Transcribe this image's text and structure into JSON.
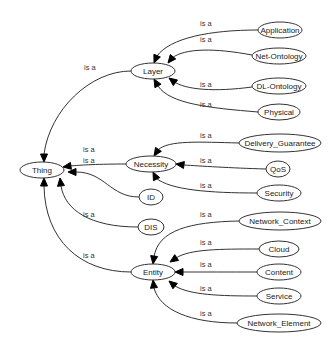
{
  "diagram": {
    "type": "ontology-graph",
    "edge_label": "is a",
    "nodes": [
      {
        "id": "Thing",
        "label": "Thing",
        "cx": 42,
        "cy": 170,
        "rx": 22,
        "ry": 8
      },
      {
        "id": "Layer",
        "label": "Layer",
        "cx": 153,
        "cy": 71,
        "rx": 22,
        "ry": 8
      },
      {
        "id": "Application",
        "label": "Application",
        "cx": 280,
        "cy": 30,
        "rx": 22,
        "ry": 8
      },
      {
        "id": "Net-Ontology",
        "label": "Net-Ontology",
        "cx": 279,
        "cy": 56,
        "rx": 27,
        "ry": 8
      },
      {
        "id": "DL-Ontology",
        "label": "DL-Ontology",
        "cx": 279,
        "cy": 86,
        "rx": 27,
        "ry": 8
      },
      {
        "id": "Physical",
        "label": "Physical",
        "cx": 279,
        "cy": 112,
        "rx": 21,
        "ry": 8
      },
      {
        "id": "Necessity",
        "label": "Necessity",
        "cx": 151,
        "cy": 164,
        "rx": 25,
        "ry": 8
      },
      {
        "id": "Delivery_Guarantee",
        "label": "Delivery_Guarantee",
        "cx": 280,
        "cy": 143,
        "rx": 41,
        "ry": 9
      },
      {
        "id": "QoS",
        "label": "QoS",
        "cx": 278,
        "cy": 169,
        "rx": 12,
        "ry": 8
      },
      {
        "id": "Security",
        "label": "Security",
        "cx": 279,
        "cy": 193,
        "rx": 22,
        "ry": 8
      },
      {
        "id": "ID",
        "label": "ID",
        "cx": 151,
        "cy": 197,
        "rx": 12,
        "ry": 8
      },
      {
        "id": "DIS",
        "label": "DIS",
        "cx": 151,
        "cy": 227,
        "rx": 13,
        "ry": 8
      },
      {
        "id": "Network_Context",
        "label": "Network_Context",
        "cx": 280,
        "cy": 221,
        "rx": 41,
        "ry": 9
      },
      {
        "id": "Cloud",
        "label": "Cloud",
        "cx": 279,
        "cy": 249,
        "rx": 20,
        "ry": 8
      },
      {
        "id": "Content",
        "label": "Content",
        "cx": 279,
        "cy": 272,
        "rx": 22,
        "ry": 8
      },
      {
        "id": "Service",
        "label": "Service",
        "cx": 279,
        "cy": 296,
        "rx": 22,
        "ry": 8
      },
      {
        "id": "Network_Element",
        "label": "Network_Element",
        "cx": 279,
        "cy": 323,
        "rx": 42,
        "ry": 9
      },
      {
        "id": "Entity",
        "label": "Entity",
        "cx": 153,
        "cy": 272,
        "rx": 22,
        "ry": 8
      }
    ],
    "edges": [
      {
        "from": "Layer",
        "to": "Thing",
        "label": "is a",
        "path": "M131,71 C90,71 50,110 44,154",
        "arrow": [
          44,
          162
        ],
        "lx": 84,
        "ly": 70
      },
      {
        "from": "Application",
        "to": "Layer",
        "label": "is a",
        "path": "M258,30 C210,30 170,38 157,56",
        "arrow": [
          154,
          63
        ],
        "lx": 200,
        "ly": 26
      },
      {
        "from": "Net-Ontology",
        "to": "Layer",
        "label": "is a",
        "path": "M252,55 C215,48 185,48 172,58",
        "arrow": [
          168,
          63
        ],
        "lx": 200,
        "ly": 42
      },
      {
        "from": "DL-Ontology",
        "to": "Layer",
        "label": "is a",
        "path": "M252,87 C215,92 185,90 173,81",
        "arrow": [
          169,
          78
        ],
        "lx": 200,
        "ly": 87
      },
      {
        "from": "Physical",
        "to": "Layer",
        "label": "is a",
        "path": "M258,112 C210,108 170,104 158,86",
        "arrow": [
          154,
          79
        ],
        "lx": 200,
        "ly": 107
      },
      {
        "from": "Necessity",
        "to": "Thing",
        "label": "is a",
        "path": "M126,164 C100,164 80,165 70,166",
        "arrow": [
          63,
          167
        ],
        "lx": 83,
        "ly": 152
      },
      {
        "from": "ID",
        "to": "Thing",
        "label": "is a",
        "path": "M139,197 C110,197 105,172 76,172",
        "arrow": [
          68,
          172
        ],
        "lx": 83,
        "ly": 163
      },
      {
        "from": "DIS",
        "to": "Thing",
        "label": "is a",
        "path": "M138,227 C90,227 65,210 61,186",
        "arrow": [
          60,
          178
        ],
        "lx": 83,
        "ly": 217
      },
      {
        "from": "Entity",
        "to": "Thing",
        "label": "is a",
        "path": "M131,272 C80,272 45,240 44,186",
        "arrow": [
          44,
          178
        ],
        "lx": 83,
        "ly": 258
      },
      {
        "from": "Delivery_Guarantee",
        "to": "Necessity",
        "label": "is a",
        "path": "M239,143 C200,142 168,140 158,150",
        "arrow": [
          154,
          156
        ],
        "lx": 200,
        "ly": 138
      },
      {
        "from": "QoS",
        "to": "Necessity",
        "label": "is a",
        "path": "M266,169 C230,168 200,166 184,165",
        "arrow": [
          176,
          164
        ],
        "lx": 200,
        "ly": 163
      },
      {
        "from": "Security",
        "to": "Necessity",
        "label": "is a",
        "path": "M257,193 C210,193 170,190 156,178",
        "arrow": [
          153,
          172
        ],
        "lx": 200,
        "ly": 188
      },
      {
        "from": "Network_Context",
        "to": "Entity",
        "label": "is a",
        "path": "M239,221 C190,222 158,230 154,257",
        "arrow": [
          153,
          264
        ],
        "lx": 200,
        "ly": 217
      },
      {
        "from": "Cloud",
        "to": "Entity",
        "label": "is a",
        "path": "M259,249 C220,249 190,249 176,258",
        "arrow": [
          170,
          262
        ],
        "lx": 200,
        "ly": 245
      },
      {
        "from": "Content",
        "to": "Entity",
        "label": "is a",
        "path": "M257,272 C230,272 200,272 183,272",
        "arrow": [
          175,
          272
        ],
        "lx": 200,
        "ly": 267
      },
      {
        "from": "Service",
        "to": "Entity",
        "label": "is a",
        "path": "M257,296 C220,296 190,295 175,286",
        "arrow": [
          169,
          281
        ],
        "lx": 200,
        "ly": 291
      },
      {
        "from": "Network_Element",
        "to": "Entity",
        "label": "is a",
        "path": "M237,323 C190,323 160,310 154,288",
        "arrow": [
          153,
          280
        ],
        "lx": 200,
        "ly": 316
      }
    ]
  }
}
